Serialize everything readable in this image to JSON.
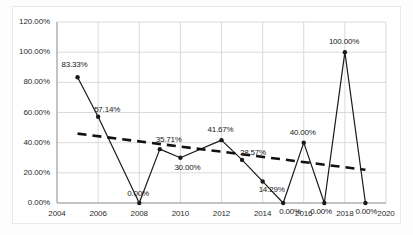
{
  "chart_data": {
    "type": "line",
    "title": "",
    "xlabel": "",
    "ylabel": "",
    "x": [
      2005,
      2006,
      2008,
      2009,
      2010,
      2012,
      2013,
      2014,
      2015,
      2016,
      2017,
      2018,
      2019
    ],
    "series": [
      {
        "name": "value",
        "values": [
          83.33,
          57.14,
          0.0,
          35.71,
          30.0,
          41.67,
          28.57,
          14.29,
          0.0,
          40.0,
          0.0,
          100.0,
          0.0
        ],
        "labels": [
          "83.33%",
          "57.14%",
          "0.00%",
          "35.71%",
          "30.00%",
          "41.67%",
          "28.57%",
          "14.29%",
          "0.00%",
          "40.00%",
          "0.00%",
          "100.00%",
          "0.00%"
        ],
        "color": "#1a1a1a",
        "marker": "circle"
      },
      {
        "name": "trendline",
        "style": "dashed",
        "color": "#111111",
        "x": [
          2005,
          2019
        ],
        "values": [
          46.0,
          22.0
        ]
      }
    ],
    "xlim": [
      2004,
      2020
    ],
    "ylim": [
      0,
      120
    ],
    "xticks": [
      2004,
      2006,
      2008,
      2010,
      2012,
      2014,
      2016,
      2018,
      2020
    ],
    "xtick_labels": [
      "2004",
      "2006",
      "2008",
      "2010",
      "2012",
      "2014",
      "2016",
      "2018",
      "2020"
    ],
    "yticks": [
      0,
      20,
      40,
      60,
      80,
      100,
      120
    ],
    "ytick_labels": [
      "0.00%",
      "20.00%",
      "40.00%",
      "60.00%",
      "80.00%",
      "100.00%",
      "120.00%"
    ],
    "grid": "both",
    "legend": "none",
    "gridline_color": "#d0d0d0",
    "plot_background": "#ffffff"
  }
}
